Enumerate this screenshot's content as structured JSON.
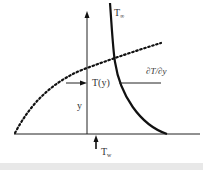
{
  "diagram": {
    "labels": {
      "t_inf": {
        "main": "T",
        "sub": "∞"
      },
      "gradient": "∂T/∂y",
      "t_of_y": "T(y)",
      "y_axis": "y",
      "t_wall": {
        "main": "T",
        "sub": "w"
      }
    },
    "colors": {
      "line": "#111111",
      "text": "#333333",
      "background": "#ffffff",
      "footer_band": "#e8e8e8"
    }
  }
}
